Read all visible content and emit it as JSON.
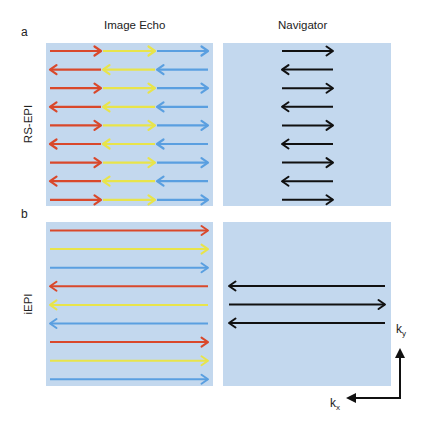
{
  "figure": {
    "columns": [
      {
        "title": "Image Echo"
      },
      {
        "title": "Navigator"
      }
    ],
    "rows": [
      {
        "letter": "a",
        "label": "RS-EPI"
      },
      {
        "letter": "b",
        "label": "iEPI"
      }
    ],
    "axes": {
      "ky_label": "k",
      "ky_sub": "y",
      "kx_label": "k",
      "kx_sub": "x"
    },
    "colors": {
      "panel_bg": "#c3d8ee",
      "red": "#d9482b",
      "yellow": "#e8e44a",
      "blue": "#5a9fe0",
      "black": "#111111"
    },
    "rs_epi_image_echo": {
      "rows": 9,
      "segments": [
        "red",
        "yellow",
        "blue"
      ],
      "directions": [
        "right",
        "left",
        "right",
        "left",
        "right",
        "left",
        "right",
        "left",
        "right"
      ]
    },
    "rs_epi_navigator": {
      "rows": 9,
      "directions": [
        "right",
        "left",
        "right",
        "left",
        "right",
        "left",
        "right",
        "left",
        "right"
      ]
    },
    "iepi_image_echo": {
      "rows": [
        {
          "color": "red",
          "direction": "right"
        },
        {
          "color": "yellow",
          "direction": "right"
        },
        {
          "color": "blue",
          "direction": "right"
        },
        {
          "color": "red",
          "direction": "left"
        },
        {
          "color": "yellow",
          "direction": "left"
        },
        {
          "color": "blue",
          "direction": "left"
        },
        {
          "color": "red",
          "direction": "right"
        },
        {
          "color": "yellow",
          "direction": "right"
        },
        {
          "color": "blue",
          "direction": "right"
        }
      ]
    },
    "iepi_navigator": {
      "directions": [
        "left",
        "right",
        "left"
      ]
    }
  }
}
